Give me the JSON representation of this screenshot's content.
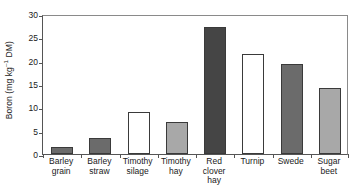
{
  "chart_data": {
    "type": "bar",
    "title": "",
    "subtitle": "",
    "xlabel": "",
    "ylabel": "Boron (mg kg⁻¹ DM)",
    "ylabel_parts": {
      "prefix": "Boron (mg kg",
      "superscript": "–1",
      "suffix": " DM)"
    },
    "categories": [
      "Barley grain",
      "Barley straw",
      "Timothy silage",
      "Timothy hay",
      "Red clover hay",
      "Turnip",
      "Swede",
      "Sugar beet"
    ],
    "category_lines": [
      [
        "Barley",
        "grain"
      ],
      [
        "Barley",
        "straw"
      ],
      [
        "Timothy",
        "silage"
      ],
      [
        "Timothy",
        "hay"
      ],
      [
        "Red",
        "clover",
        "hay"
      ],
      [
        "Turnip"
      ],
      [
        "Swede"
      ],
      [
        "Sugar",
        "beet"
      ]
    ],
    "values": [
      1.4,
      3.5,
      8.9,
      6.8,
      27.2,
      21.4,
      19.3,
      14.2
    ],
    "bar_colors": [
      "#6b6b6b",
      "#6b6b6b",
      "#ffffff",
      "#a8a8a8",
      "#454545",
      "#ffffff",
      "#6b6b6b",
      "#a8a8a8"
    ],
    "bar_edge_color": "#3a3a3a",
    "ylim": [
      0,
      30
    ],
    "yticks": [
      0,
      5,
      10,
      15,
      20,
      25,
      30
    ],
    "ytick_labels": [
      "0",
      "5",
      "10",
      "15",
      "20",
      "25",
      "30"
    ],
    "grid": false,
    "legend": null,
    "frame": true,
    "background_color": "#ffffff",
    "axis_color": "#555555"
  }
}
